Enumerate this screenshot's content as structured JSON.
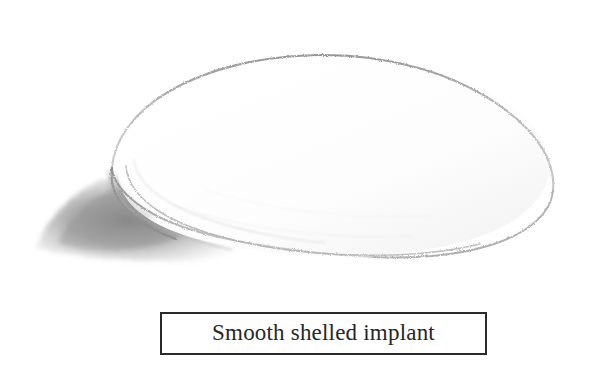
{
  "figure": {
    "title": "Smooth shelled implant",
    "medium": "pencil sketch",
    "background_color": "#ffffff"
  },
  "drawing": {
    "subject_name": "smooth-shelled-implant",
    "description": "Oval dome-shaped breast implant drawn in graphite, seen in three-quarter view",
    "outline_color": "#9a9a9a",
    "inner_rim_color": "#b4b4b4",
    "shadow_color": "#8c8c8c",
    "fill_color": "#ffffff",
    "shadow_label": "cast-shadow"
  },
  "caption": {
    "text": "Smooth shelled implant",
    "border_color": "#2a2a2a",
    "text_color": "#262626"
  }
}
